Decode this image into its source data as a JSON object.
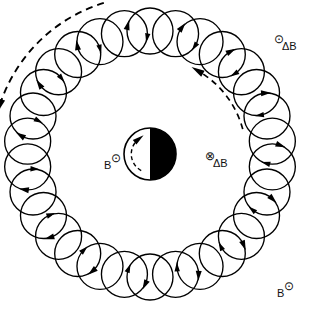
{
  "figure": {
    "background_color": "#ffffff",
    "ink_color": "#000000",
    "center": {
      "x": 150,
      "y": 154
    },
    "planet": {
      "name": "central-body",
      "cx": 150,
      "cy": 154,
      "r": 26,
      "lit_half": "left",
      "dark_half": "right",
      "dark_color": "#000000",
      "lit_color": "#ffffff",
      "inner_dashed_arrow": "counterclockwise"
    },
    "ring": {
      "name": "ring-current-torus",
      "inner_radius": 104,
      "outer_radius": 146,
      "gyro_circle_radius": 23,
      "gyro_circle_count": 30,
      "gyro_center_radius": 123,
      "arrow_sense": "clockwise-on-gyrocircle"
    },
    "outer_dashed_arc": {
      "name": "outer-drift-arrow",
      "radius": 158,
      "start_angle_deg": 205,
      "end_angle_deg": 250,
      "arrow_direction": "clockwise",
      "style": "dashed"
    },
    "inner_dashed_arc": {
      "name": "inner-drift-arrow",
      "radius": 96,
      "start_angle_deg": 330,
      "end_angle_deg": 295,
      "arrow_direction": "counterclockwise",
      "style": "dashed"
    }
  },
  "labels": {
    "b_left": {
      "name": "b-field-left",
      "base": "B",
      "symbol": "⊙",
      "symbol_meaning": "out-of-page",
      "position": "inside-ring-left"
    },
    "delta_b_right": {
      "name": "delta-b-inside-right",
      "symbol": "⊗",
      "symbol_meaning": "into-page",
      "base": "ΔB",
      "position": "inside-ring-right"
    },
    "delta_b_top_right": {
      "name": "delta-b-outside-topright",
      "symbol": "⊙",
      "symbol_meaning": "out-of-page",
      "base": "ΔB",
      "position": "outside-ring-top-right"
    },
    "b_bottom_right": {
      "name": "b-field-outside-bottomright",
      "base": "B",
      "symbol": "⊙",
      "symbol_meaning": "out-of-page",
      "position": "outside-ring-bottom-right"
    }
  },
  "caption_strip": {
    "text": "",
    "visible": false
  }
}
